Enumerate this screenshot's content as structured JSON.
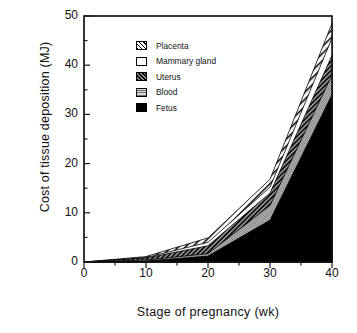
{
  "chart_data": {
    "type": "area",
    "title": "",
    "xlabel": "Stage of pregnancy (wk)",
    "ylabel": "Cost of tissue deposition (MJ)",
    "xlim": [
      0,
      40
    ],
    "ylim": [
      0,
      50
    ],
    "xticks": [
      "0",
      "10",
      "20",
      "30",
      "40"
    ],
    "yticks": [
      "0",
      "10",
      "20",
      "30",
      "40",
      "50"
    ],
    "grid": false,
    "legend_position": "upper-left-inside",
    "stacked": true,
    "stack_order_bottom_to_top": [
      "Fetus",
      "Blood",
      "Uterus",
      "Mammary gland",
      "Placenta"
    ],
    "x": [
      0,
      10,
      20,
      30,
      40
    ],
    "series": [
      {
        "name": "Fetus",
        "values": [
          0,
          0.2,
          1.2,
          8.5,
          34.0
        ],
        "swatch": "sw-fetus"
      },
      {
        "name": "Blood",
        "values": [
          0,
          0.2,
          0.5,
          3.0,
          4.0
        ],
        "swatch": "sw-blood"
      },
      {
        "name": "Uterus",
        "values": [
          0,
          0.4,
          1.6,
          2.5,
          4.0
        ],
        "swatch": "sw-uterus"
      },
      {
        "name": "Mammary gland",
        "values": [
          0,
          0.1,
          0.7,
          1.2,
          3.5
        ],
        "swatch": "sw-mammary"
      },
      {
        "name": "Placenta",
        "values": [
          0,
          0.2,
          0.9,
          1.6,
          3.0
        ],
        "swatch": "sw-placenta"
      }
    ],
    "cumulative_tops": {
      "Fetus": [
        0,
        0.2,
        1.2,
        8.5,
        34.0
      ],
      "Blood": [
        0,
        0.4,
        1.7,
        11.5,
        38.0
      ],
      "Uterus": [
        0,
        0.8,
        3.3,
        14.0,
        42.0
      ],
      "Mammary gland": [
        0,
        0.9,
        4.0,
        15.2,
        45.5
      ],
      "Placenta": [
        0,
        1.1,
        4.9,
        16.8,
        48.5
      ]
    },
    "total": [
      0,
      1.1,
      4.9,
      16.8,
      48.5
    ]
  },
  "legend": {
    "items": [
      {
        "label": "Placenta"
      },
      {
        "label": "Mammary gland"
      },
      {
        "label": "Uterus"
      },
      {
        "label": "Blood"
      },
      {
        "label": "Fetus"
      }
    ]
  },
  "axes": {
    "x_ticks": [
      {
        "label": "0"
      },
      {
        "label": "10"
      },
      {
        "label": "20"
      },
      {
        "label": "30"
      },
      {
        "label": "40"
      }
    ],
    "y_ticks": [
      {
        "label": "50"
      },
      {
        "label": "40"
      },
      {
        "label": "30"
      },
      {
        "label": "20"
      },
      {
        "label": "10"
      },
      {
        "label": "0"
      }
    ]
  },
  "colors": {
    "axis": "#1a1a1a",
    "fetus": "#000000",
    "blood": "#b8b8b8",
    "uterus": "#2a2a2a",
    "mammary": "#ffffff",
    "placenta": "#ffffff",
    "background": "#ffffff"
  }
}
